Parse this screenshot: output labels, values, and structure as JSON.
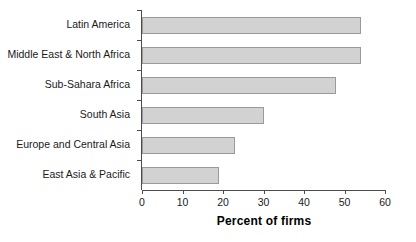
{
  "chart_data": {
    "type": "bar",
    "orientation": "horizontal",
    "title": "",
    "xlabel": "Percent of firms",
    "ylabel": "",
    "categories": [
      "Latin America",
      "Middle East & North Africa",
      "Sub-Sahara Africa",
      "South Asia",
      "Europe and Central Asia",
      "East Asia & Pacific"
    ],
    "values": [
      54,
      54,
      48,
      30,
      23,
      19
    ],
    "xlim": [
      0,
      60
    ],
    "xticks": [
      0,
      10,
      20,
      30,
      40,
      50,
      60
    ],
    "xtick_labels": [
      "0",
      "10",
      "20",
      "30",
      "40",
      "50",
      "60"
    ],
    "grid": false,
    "legend": null,
    "bar_fill_color": "#d2d2d2",
    "bar_border_color": "#9a9a9a",
    "axis_color": "#4d4d4d",
    "text_color": "#1a1a1a"
  }
}
